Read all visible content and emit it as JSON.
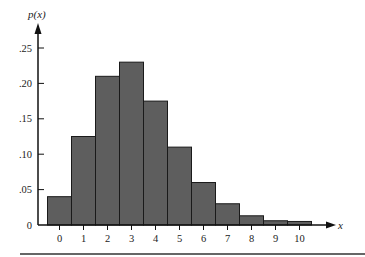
{
  "chart_data": {
    "type": "bar",
    "title": "",
    "xlabel": "x",
    "ylabel": "p(x)",
    "categories": [
      "0",
      "1",
      "2",
      "3",
      "4",
      "5",
      "6",
      "7",
      "8",
      "9",
      "10"
    ],
    "values": [
      0.04,
      0.125,
      0.21,
      0.23,
      0.175,
      0.11,
      0.06,
      0.03,
      0.013,
      0.006,
      0.005
    ],
    "ylim": [
      0,
      0.25
    ],
    "yticks": [
      0,
      0.05,
      0.1,
      0.15,
      0.2,
      0.25
    ],
    "ytick_labels": [
      "0",
      ".05",
      ".10",
      ".15",
      ".20",
      ".25"
    ],
    "grid": false,
    "legend": null,
    "bar_fill": "#5e5e5e",
    "bar_edge": "#1a1a1a"
  }
}
